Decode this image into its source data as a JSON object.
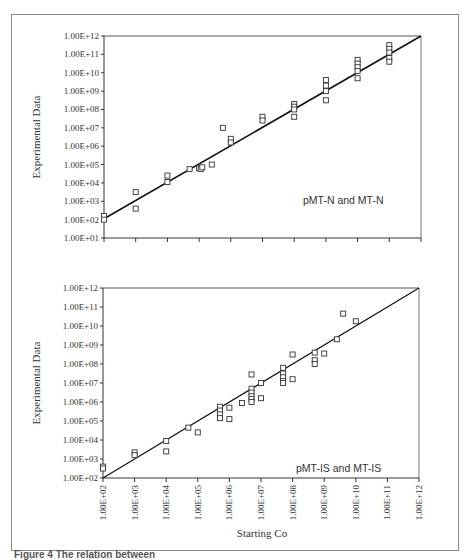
{
  "figure": {
    "xlabel": "Starting Co",
    "caption": "Figure 4 The relation between"
  },
  "chart_data": [
    {
      "type": "scatter",
      "title": "",
      "annotation": "pMT-N and MT-N",
      "xlabel": "Starting Co",
      "ylabel": "Experimental Data",
      "xscale": "log",
      "yscale": "log",
      "xlim": [
        100,
        1000000000000.0
      ],
      "ylim": [
        10,
        1000000000000.0
      ],
      "x_tick_labels_shown": false,
      "y_tick_labels": [
        "1.00E+01",
        "1.00E+02",
        "1.00E+03",
        "1.00E+04",
        "1.00E+05",
        "1.00E+06",
        "1.00E+07",
        "1.00E+08",
        "1.00E+09",
        "1.00E+10",
        "1.00E+11",
        "1.00E+12"
      ],
      "grid": false,
      "legend": null,
      "fit_line": {
        "x": [
          100,
          1000000000000.0
        ],
        "y": [
          112,
          1000000000000.0
        ]
      },
      "log10_points": [
        [
          2,
          2.2
        ],
        [
          2,
          2.0
        ],
        [
          3,
          3.5
        ],
        [
          3,
          2.6
        ],
        [
          4,
          4.4
        ],
        [
          4,
          4.05
        ],
        [
          4.7,
          4.75
        ],
        [
          5.0,
          4.8
        ],
        [
          5.05,
          4.75
        ],
        [
          5.1,
          4.85
        ],
        [
          5.4,
          5.0
        ],
        [
          5.75,
          7.0
        ],
        [
          6,
          6.4
        ],
        [
          6,
          6.2
        ],
        [
          7,
          7.6
        ],
        [
          7,
          7.4
        ],
        [
          8,
          8.3
        ],
        [
          8,
          8.15
        ],
        [
          8,
          8.0
        ],
        [
          8,
          7.6
        ],
        [
          9,
          9.6
        ],
        [
          9,
          9.3
        ],
        [
          9,
          9.0
        ],
        [
          9,
          8.5
        ],
        [
          10,
          10.7
        ],
        [
          10,
          10.5
        ],
        [
          10,
          10.3
        ],
        [
          10,
          10.1
        ],
        [
          10,
          9.7
        ],
        [
          11,
          11.5
        ],
        [
          11,
          11.3
        ],
        [
          11,
          11.1
        ],
        [
          11,
          10.8
        ],
        [
          11,
          10.6
        ]
      ]
    },
    {
      "type": "scatter",
      "title": "",
      "annotation": "pMT-IS  and  MT-IS",
      "xlabel": "Starting Co",
      "ylabel": "Experimental Data",
      "xscale": "log",
      "yscale": "log",
      "xlim": [
        100,
        1000000000000.0
      ],
      "ylim": [
        100,
        1000000000000.0
      ],
      "x_tick_labels": [
        "1.00E+02",
        "1.00E+03",
        "1.00E+04",
        "1.00E+05",
        "1.00E+06",
        "1.00E+07",
        "1.00E+08",
        "1.00E+09",
        "1.00E+10",
        "1.00E+11",
        "1.00E+12"
      ],
      "y_tick_labels": [
        "1.00E+02",
        "1.00E+03",
        "1.00E+04",
        "1.00E+05",
        "1.00E+06",
        "1.00E+07",
        "1.00E+08",
        "1.00E+09",
        "1.00E+10",
        "1.00E+11",
        "1.00E+12"
      ],
      "grid": false,
      "legend": null,
      "fit_line": {
        "x": [
          100,
          1000000000000.0
        ],
        "y": [
          100,
          1000000000000.0
        ]
      },
      "log10_points": [
        [
          2,
          2.6
        ],
        [
          2,
          2.5
        ],
        [
          3,
          3.35
        ],
        [
          3,
          3.2
        ],
        [
          4,
          3.95
        ],
        [
          4,
          3.4
        ],
        [
          4.7,
          4.65
        ],
        [
          5.0,
          4.4
        ],
        [
          5.7,
          5.75
        ],
        [
          5.7,
          5.55
        ],
        [
          5.7,
          5.35
        ],
        [
          5.7,
          5.15
        ],
        [
          6,
          5.7
        ],
        [
          6,
          5.1
        ],
        [
          6.4,
          5.95
        ],
        [
          6.7,
          7.45
        ],
        [
          6.7,
          6.7
        ],
        [
          6.7,
          6.5
        ],
        [
          6.7,
          6.3
        ],
        [
          6.7,
          6.15
        ],
        [
          6.7,
          6.0
        ],
        [
          7,
          7.0
        ],
        [
          7,
          6.2
        ],
        [
          7.7,
          7.8
        ],
        [
          7.7,
          7.5
        ],
        [
          7.7,
          7.3
        ],
        [
          7.7,
          7.1
        ],
        [
          7.7,
          7.0
        ],
        [
          8,
          8.5
        ],
        [
          8,
          7.2
        ],
        [
          8.7,
          8.6
        ],
        [
          8.7,
          8.2
        ],
        [
          8.7,
          8.0
        ],
        [
          9,
          8.55
        ],
        [
          9.4,
          9.3
        ],
        [
          9.6,
          10.65
        ],
        [
          10,
          10.25
        ]
      ]
    }
  ]
}
